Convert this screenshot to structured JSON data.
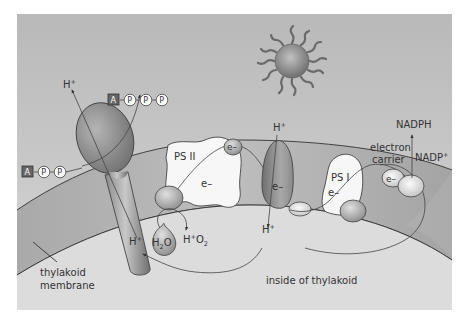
{
  "diagram": {
    "type": "photosynthesis light reactions across thylakoid membrane",
    "colors": {
      "stroma_background": "#bdbdbd",
      "lumen_background": "#d9d9d9",
      "membrane_band": "#a8a8a8",
      "protein_dark": "#7a7a7a",
      "protein_light": "#f4f4f4",
      "sun_core": "#8c8c8c"
    },
    "labels": {
      "h_plus_top_left": {
        "base": "H",
        "sup": "+"
      },
      "h_plus_center": {
        "base": "H",
        "sup": "+"
      },
      "h_plus_below_synthase": {
        "base": "H",
        "sup": "+"
      },
      "h_plus_below_cytochrome": {
        "base": "H",
        "sup": "+"
      },
      "h_plus_o2": {
        "base": "H",
        "sup": "+",
        "tail": "O",
        "sub": "2"
      },
      "water": {
        "base": "H",
        "sub": "2",
        "tail": "O"
      },
      "ps2": "PS II",
      "ps1": "PS I",
      "electron_ps2": "e–",
      "electron_cytochrome": "e–",
      "electron_ps1": "e–",
      "electron_top_ps2": "e–",
      "electron_carrier_e": "e–",
      "electron_carrier_line1": "electron",
      "electron_carrier_line2": "carrier",
      "nadph": "NADPH",
      "nadp_plus": {
        "base": "NADP",
        "sup": "+"
      },
      "thylakoid_membrane_line1": "thylakoid",
      "thylakoid_membrane_line2": "membrane",
      "inside_of_thylakoid": "inside of thylakoid"
    },
    "atp": {
      "adenine": "A",
      "phosphates": [
        "P",
        "P",
        "P"
      ]
    },
    "adp": {
      "adenine": "A",
      "phosphates": [
        "P",
        "P"
      ]
    },
    "icons": {
      "sun": "sun-icon",
      "atp_synthase": "atp-synthase-icon",
      "photosystem_2": "photosystem-ii-icon",
      "cytochrome": "cytochrome-complex-icon",
      "photosystem_1": "photosystem-i-icon",
      "water_drop": "water-drop-icon"
    }
  }
}
